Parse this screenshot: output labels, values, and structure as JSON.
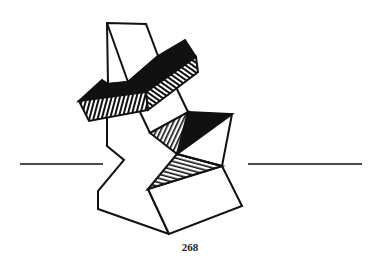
{
  "page": {
    "page_number": "268",
    "illustration": "abstract-stacked-geometric-sculpture",
    "colors": {
      "ink": "#111111",
      "paper": "#ffffff"
    }
  }
}
